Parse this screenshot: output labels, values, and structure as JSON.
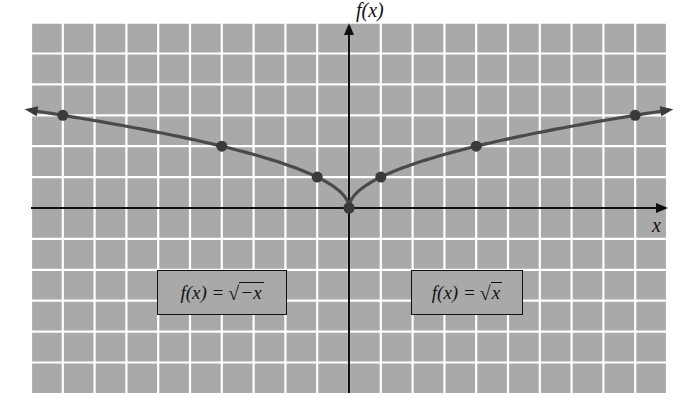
{
  "chart_data": {
    "type": "line",
    "title": "",
    "xlabel": "x",
    "ylabel": "f(x)",
    "grid": true,
    "xlim": [
      -10,
      10
    ],
    "ylim": [
      -6,
      6
    ],
    "series": [
      {
        "name": "f(x) = √−x",
        "x": [
          -9,
          -4,
          -1,
          0
        ],
        "y": [
          3,
          2,
          1,
          0
        ],
        "markers": true,
        "extends_left": true
      },
      {
        "name": "f(x) = √x",
        "x": [
          0,
          1,
          4,
          9
        ],
        "y": [
          0,
          1,
          2,
          3
        ],
        "markers": true,
        "extends_right": true
      }
    ],
    "annotations": [
      {
        "text": "f(x) = √−x",
        "position": "lower-left",
        "boxed": true
      },
      {
        "text": "f(x) = √x",
        "position": "lower-right",
        "boxed": true
      }
    ]
  },
  "labels": {
    "x_axis": "x",
    "y_axis": "f(x)",
    "eq_left": {
      "lhs": "f(x) = ",
      "radical": "√",
      "arg": "−x"
    },
    "eq_right": {
      "lhs": "f(x) = ",
      "radical": "√",
      "arg": "x"
    }
  },
  "colors": {
    "grid_bg": "#a9a9a9",
    "grid_lines": "#ffffff",
    "axes": "#111111",
    "curve": "#4a4a4a"
  }
}
